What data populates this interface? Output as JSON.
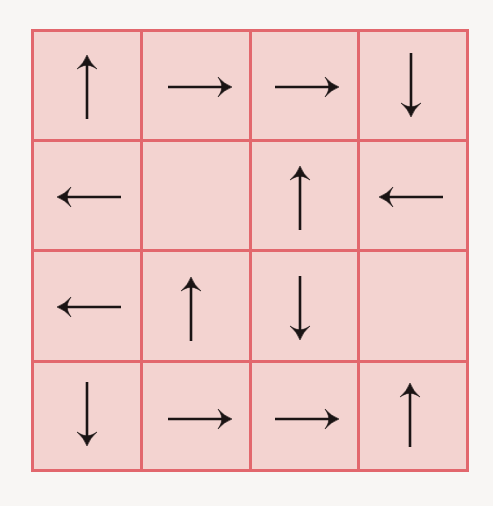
{
  "diagram": {
    "type": "arrow-grid",
    "rows": 4,
    "cols": 4,
    "colors": {
      "background": "#f8f6f4",
      "cell_fill": "#f3d3d0",
      "grid_line": "#e2676d",
      "arrow": "#1a1414"
    },
    "cells": [
      [
        {
          "row": 0,
          "col": 0,
          "arrow": "up",
          "icon": "arrow-up-icon"
        },
        {
          "row": 0,
          "col": 1,
          "arrow": "right",
          "icon": "arrow-right-icon"
        },
        {
          "row": 0,
          "col": 2,
          "arrow": "right",
          "icon": "arrow-right-icon"
        },
        {
          "row": 0,
          "col": 3,
          "arrow": "down",
          "icon": "arrow-down-icon"
        }
      ],
      [
        {
          "row": 1,
          "col": 0,
          "arrow": "left",
          "icon": "arrow-left-icon"
        },
        {
          "row": 1,
          "col": 1,
          "arrow": "none",
          "icon": ""
        },
        {
          "row": 1,
          "col": 2,
          "arrow": "up",
          "icon": "arrow-up-icon"
        },
        {
          "row": 1,
          "col": 3,
          "arrow": "left",
          "icon": "arrow-left-icon"
        }
      ],
      [
        {
          "row": 2,
          "col": 0,
          "arrow": "left",
          "icon": "arrow-left-icon"
        },
        {
          "row": 2,
          "col": 1,
          "arrow": "up",
          "icon": "arrow-up-icon"
        },
        {
          "row": 2,
          "col": 2,
          "arrow": "down",
          "icon": "arrow-down-icon"
        },
        {
          "row": 2,
          "col": 3,
          "arrow": "none",
          "icon": ""
        }
      ],
      [
        {
          "row": 3,
          "col": 0,
          "arrow": "down",
          "icon": "arrow-down-icon"
        },
        {
          "row": 3,
          "col": 1,
          "arrow": "right",
          "icon": "arrow-right-icon"
        },
        {
          "row": 3,
          "col": 2,
          "arrow": "right",
          "icon": "arrow-right-icon"
        },
        {
          "row": 3,
          "col": 3,
          "arrow": "up",
          "icon": "arrow-up-icon"
        }
      ]
    ],
    "arrow_glyphs": {
      "up": "↑",
      "down": "↓",
      "left": "←",
      "right": "→"
    }
  }
}
